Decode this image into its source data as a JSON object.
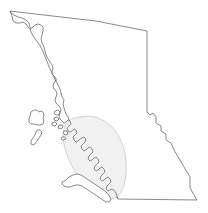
{
  "figure": {
    "kind": "map-outline",
    "background_color": "#ffffff",
    "width": 208,
    "height": 213
  },
  "styles": {
    "outline_stroke": "#6b6b6b",
    "outline_stroke_width": 0.8,
    "outline_fill": "#ffffff",
    "coastline_stroke": "#5a5a5a",
    "coastline_stroke_width": 0.7,
    "island_stroke": "#5a5a5a",
    "island_stroke_width": 0.7,
    "highlight_fill": "#f1f1f1",
    "highlight_stroke": "#c9c9c9",
    "highlight_stroke_width": 0.8
  },
  "regions": {
    "province": {
      "name": "British Columbia",
      "label": "",
      "path": "M 10 11 L 44 15 L 96 21 L 147 31 L 147 31 L 147 112 L 150 115 L 153 113 L 156 117 L 156 123 L 161 126 L 161 131 L 166 134 L 166 140 L 171 143 L 175 152 L 180 160 L 184 167 L 190 177 L 190 188 L 197 200 L 118 199 L 116 197 L 113 191 L 110 186 L 108 180 L 107 174 L 104 168 L 101 163 L 99 157 L 96 152 L 93 147 L 90 143 L 87 139 L 84 136 L 81 133 L 78 131 L 76 128 L 73 126 L 71 123 L 69 120 L 68 117 L 66 114 L 65 111 L 64 108 L 63 104 L 64 100 L 62 97 L 61 93 L 60 89 L 58 85 L 56 81 L 54 77 L 52 73 L 50 69 L 48 64 L 46 59 L 44 54 L 42 49 L 39 44 L 36 40 L 33 36 L 31 32 L 30 27 L 29 23 L 26 20 L 22 18 L 18 17 L 14 15 L 11 13 Z"
    },
    "panhandle_border": {
      "name": "Alaska panhandle boundary",
      "path": "M 10 11 L 12 16 L 13 21 L 16 23 L 20 23 L 23 22 L 26 24 L 28 27 L 30 29 L 33 27 L 35 25 L 38 24 L 41 25 L 43 27 L 43 31 L 42 35 L 41 39 L 42 43 L 44 47 L 45 51 L 46 55 L 48 59 L 50 62 L 52 65 L 53 68 L 52 71 L 52 74 L 54 76 L 56 78 L 56 81 L 54 83 L 53 86 L 54 89 L 56 91 L 57 94 L 56 97 L 55 100 L 56 103 L 58 105 L 60 107 L 61 110 L 60 113 L 59 116 L 60 119 L 62 121"
    },
    "coastline": {
      "name": "mainland coastline",
      "path": "M 62 121 L 64 123 L 66 122 L 68 120 L 70 121 L 71 124 L 69 126 L 67 128 L 68 131 L 70 132 L 72 131 L 74 129 L 76 130 L 77 133 L 75 135 L 73 137 L 74 140 L 76 142 L 78 141 L 80 139 L 82 138 L 84 137 L 86 139 L 85 142 L 83 144 L 81 146 L 82 149 L 84 151 L 86 150 L 88 148 L 90 147 L 92 149 L 93 152 L 91 154 L 89 156 L 88 159 L 90 161 L 92 160 L 94 158 L 96 157 L 98 159 L 99 162 L 97 164 L 95 166 L 94 169 L 96 171 L 98 170 L 100 168 L 102 167 L 104 169 L 105 172 L 103 174 L 101 176 L 100 179 L 102 181 L 104 180 L 106 178 L 108 177 L 110 179 L 111 182 L 109 184 L 107 186 L 106 189 L 108 191 L 110 190 L 112 189 L 114 190 L 116 193 L 117 196 L 118 199"
    },
    "vancouver_island": {
      "name": "Vancouver Island",
      "path": "M 66 180 L 69 177 L 73 175 L 77 174 L 81 175 L 84 177 L 87 179 L 90 181 L 93 183 L 96 185 L 99 187 L 102 189 L 105 191 L 108 194 L 110 197 L 111 200 L 109 202 L 106 202 L 103 200 L 100 198 L 97 196 L 94 194 L 91 192 L 88 190 L 85 188 L 82 186 L 79 185 L 76 185 L 73 186 L 70 187 L 67 187 L 64 186 L 62 184 L 62 182 Z"
    },
    "haida_gwaii_north": {
      "name": "Haida Gwaii north island",
      "path": "M 31 112 L 34 110 L 37 110 L 39 112 L 41 111 L 43 112 L 44 115 L 43 118 L 44 121 L 43 124 L 40 125 L 37 125 L 34 124 L 31 124 L 29 122 L 29 119 L 30 116 Z"
    },
    "haida_gwaii_south": {
      "name": "Haida Gwaii south island",
      "path": "M 37 130 L 40 130 L 42 132 L 41 135 L 39 138 L 37 141 L 35 144 L 33 145 L 31 144 L 31 141 L 33 138 L 35 135 L 36 132 Z"
    },
    "small_islands": {
      "name": "coastal small islands",
      "paths": [
        "M 55 111 L 58 110 L 60 112 L 59 115 L 56 115 L 54 113 Z",
        "M 54 118 L 57 117 L 59 119 L 57 121 L 54 120 Z",
        "M 52 123 L 55 122 L 57 124 L 55 126 L 52 125 Z",
        "M 59 125 L 62 125 L 63 127 L 61 129 L 58 128 Z",
        "M 64 131 L 67 131 L 68 134 L 65 135 L 63 133 Z",
        "M 62 137 L 65 137 L 66 139 L 63 140 L 61 139 Z"
      ]
    },
    "highlight": {
      "name": "highlighted coastal study area",
      "label": "",
      "path": "M 80 117 Q 98 113 112 127 Q 124 140 126 160 Q 128 180 121 192 Q 116 200 108 199 Q 96 197 84 184 Q 72 170 66 152 Q 60 134 66 124 Q 71 117 80 117 Z"
    }
  }
}
